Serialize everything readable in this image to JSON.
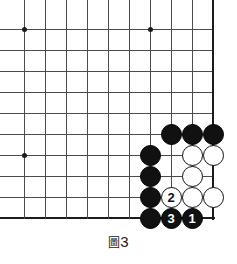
{
  "figure": {
    "type": "go-board-diagram",
    "caption_label": "圖",
    "caption_number": "3",
    "caption_full": "圖3"
  },
  "board": {
    "origin_x": 24,
    "origin_y": 29,
    "spacing": 21,
    "columns": 10,
    "rows": 10,
    "right_edge_is_board_border": true,
    "bottom_edge_is_board_border": true,
    "line_color": "#4a4a4a",
    "edge_color": "#1c1c1c",
    "background": "#ffffff",
    "star_points": [
      {
        "col": 0,
        "row": 0
      },
      {
        "col": 6,
        "row": 0
      },
      {
        "col": 0,
        "row": 6
      }
    ]
  },
  "stones": [
    {
      "color": "black",
      "col": 7,
      "row": 5,
      "label": ""
    },
    {
      "color": "black",
      "col": 8,
      "row": 5,
      "label": ""
    },
    {
      "color": "black",
      "col": 9,
      "row": 5,
      "label": ""
    },
    {
      "color": "black",
      "col": 6,
      "row": 6,
      "label": ""
    },
    {
      "color": "black",
      "col": 6,
      "row": 7,
      "label": ""
    },
    {
      "color": "black",
      "col": 6,
      "row": 8,
      "label": ""
    },
    {
      "color": "black",
      "col": 6,
      "row": 9,
      "label": ""
    },
    {
      "color": "white",
      "col": 8,
      "row": 6,
      "label": ""
    },
    {
      "color": "white",
      "col": 9,
      "row": 6,
      "label": ""
    },
    {
      "color": "white",
      "col": 8,
      "row": 7,
      "label": ""
    },
    {
      "color": "white",
      "col": 8,
      "row": 8,
      "label": ""
    },
    {
      "color": "white",
      "col": 9,
      "row": 8,
      "label": ""
    },
    {
      "color": "white",
      "col": 7,
      "row": 8,
      "label": "2"
    },
    {
      "color": "black",
      "col": 7,
      "row": 9,
      "label": "3"
    },
    {
      "color": "black",
      "col": 8,
      "row": 9,
      "label": "1"
    }
  ],
  "move_sequence": [
    {
      "number": "1",
      "color": "black"
    },
    {
      "number": "2",
      "color": "white"
    },
    {
      "number": "3",
      "color": "black"
    }
  ]
}
